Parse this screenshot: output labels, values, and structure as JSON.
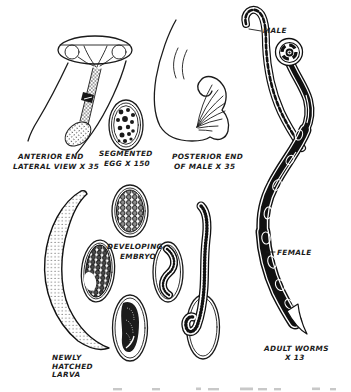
{
  "figure": {
    "colors": {
      "ink": "#1b1b1b",
      "paper": "#ffffff",
      "remnant": "#b5b5b5"
    },
    "labels": {
      "anterior": [
        "ANTERIOR END",
        "LATERAL VIEW X 35"
      ],
      "segmented_egg": [
        "SEGMENTED",
        "EGG X 150"
      ],
      "posterior": [
        "POSTERIOR END",
        "OF MALE  X 35"
      ],
      "male": "MALE",
      "female": "FEMALE",
      "developing_embryo": [
        "DEVELOPING",
        "EMBRYO"
      ],
      "newly_hatched_larva": [
        "NEWLY",
        "HATCHED",
        "LARVA"
      ],
      "adult_worms": [
        "ADULT WORMS",
        "X 13"
      ]
    }
  }
}
